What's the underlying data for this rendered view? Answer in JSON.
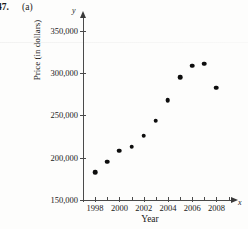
{
  "figure": {
    "problem_number": "47.",
    "part_label": "(a)"
  },
  "axis_names": {
    "y_symbol": "y",
    "x_symbol": "x"
  },
  "chart_data": {
    "type": "scatter",
    "title": "",
    "xlabel": "Year",
    "ylabel": "Price (in dollars)",
    "xlim": [
      1997,
      2009.2
    ],
    "ylim": [
      150000,
      358000
    ],
    "grid": false,
    "legend": null,
    "y_ticks": [
      150000,
      200000,
      250000,
      300000,
      350000
    ],
    "y_tick_labels": [
      "150,000",
      "200,000",
      "250,000",
      "300,000",
      "350,000"
    ],
    "x_ticks": [
      1998,
      2000,
      2002,
      2004,
      2006,
      2008
    ],
    "x_tick_labels": [
      "1998",
      "2000",
      "2002",
      "2004",
      "2006",
      "2008"
    ],
    "x_minor_ticks": [
      1999,
      2001,
      2003,
      2005,
      2007,
      2009
    ],
    "x": [
      1998,
      1999,
      2000,
      2001,
      2002,
      2003,
      2004,
      2005,
      2006,
      2007,
      2008
    ],
    "y": [
      183000,
      195000,
      208000,
      213000,
      226000,
      244000,
      268000,
      295000,
      309000,
      311000,
      283000
    ],
    "points": [
      {
        "year": 1998,
        "price": 183000
      },
      {
        "year": 1999,
        "price": 195000
      },
      {
        "year": 2000,
        "price": 208000
      },
      {
        "year": 2001,
        "price": 213000
      },
      {
        "year": 2002,
        "price": 226000
      },
      {
        "year": 2003,
        "price": 244000
      },
      {
        "year": 2004,
        "price": 268000
      },
      {
        "year": 2005,
        "price": 295000
      },
      {
        "year": 2006,
        "price": 309000
      },
      {
        "year": 2007,
        "price": 311000
      },
      {
        "year": 2008,
        "price": 283000
      }
    ]
  }
}
